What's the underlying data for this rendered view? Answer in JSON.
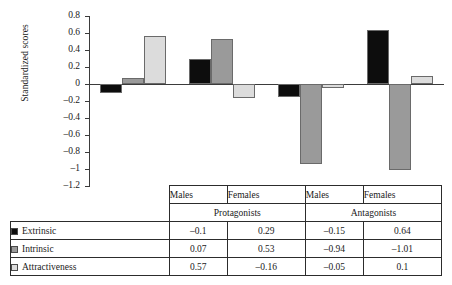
{
  "chart_data": {
    "type": "bar",
    "title": "",
    "xlabel": "",
    "ylabel": "Standardized scores",
    "ylim": [
      -1.2,
      0.8
    ],
    "grid": false,
    "legend_position": "table-left",
    "categories": [
      "Males",
      "Females",
      "Males",
      "Females"
    ],
    "supercategories": [
      "Protagonists",
      "Antagonists"
    ],
    "yticks": [
      "0.8",
      "0.6",
      "0.4",
      "0.2",
      "0",
      "–0.2",
      "–0.4",
      "–0.6",
      "–0.8",
      "–1",
      "–1.2"
    ],
    "ytick_values": [
      0.8,
      0.6,
      0.4,
      0.2,
      0,
      -0.2,
      -0.4,
      -0.6,
      -0.8,
      -1,
      -1.2
    ],
    "series": [
      {
        "name": "Extrinsic",
        "color": "#0d0d0d",
        "values": [
          -0.1,
          0.29,
          -0.15,
          0.64
        ],
        "labels": [
          "–0.1",
          "0.29",
          "–0.15",
          "0.64"
        ]
      },
      {
        "name": "Intrinsic",
        "color": "#9a9a9a",
        "values": [
          0.07,
          0.53,
          -0.94,
          -1.01
        ],
        "labels": [
          "0.07",
          "0.53",
          "–0.94",
          "–1.01"
        ]
      },
      {
        "name": "Attractiveness",
        "color": "#dcdcdc",
        "values": [
          0.57,
          -0.16,
          -0.05,
          0.1
        ],
        "labels": [
          "0.57",
          "–0.16",
          "–0.05",
          "0.1"
        ]
      }
    ]
  },
  "table": {
    "group_headers": [
      "Males",
      "Females",
      "Males",
      "Females"
    ],
    "group_names": [
      "Protagonists",
      "Antagonists"
    ],
    "rows": [
      {
        "label": "Extrinsic",
        "color": "#0d0d0d",
        "values": [
          "–0.1",
          "0.29",
          "–0.15",
          "0.64"
        ]
      },
      {
        "label": "Intrinsic",
        "color": "#9a9a9a",
        "values": [
          "0.07",
          "0.53",
          "–0.94",
          "–1.01"
        ]
      },
      {
        "label": "Attractiveness",
        "color": "#dcdcdc",
        "values": [
          "0.57",
          "–0.16",
          "–0.05",
          "0.1"
        ]
      }
    ]
  }
}
